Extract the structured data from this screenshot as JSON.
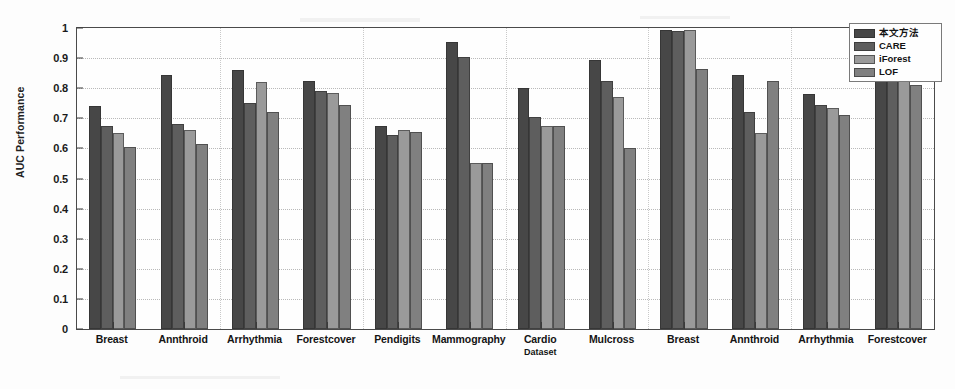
{
  "chart_data": {
    "type": "bar",
    "title": "",
    "subtitle": "",
    "xlabel": "Dataset",
    "ylabel": "AUC Performance",
    "ylim": [
      0,
      1
    ],
    "ytick_labels": [
      "0",
      "0.1",
      "0.2",
      "0.3",
      "0.4",
      "0.5",
      "0.6",
      "0.7",
      "0.8",
      "0.9",
      "1"
    ],
    "ytick_values": [
      0,
      0.1,
      0.2,
      0.3,
      0.4,
      0.5,
      0.6,
      0.7,
      0.8,
      0.9,
      1
    ],
    "grid": true,
    "legend_position": "top-right",
    "categories": [
      "Breast",
      "Annthroid",
      "Arrhythmia",
      "Forestcover",
      "Pendigits",
      "Mammography",
      "Cardio",
      "Mulcross",
      "Breast",
      "Annthroid",
      "Arrhythmia",
      "Forestcover"
    ],
    "series": [
      {
        "name": "本文方法",
        "color": "#474747",
        "values": [
          0.74,
          0.845,
          0.86,
          0.825,
          0.675,
          0.955,
          0.8,
          0.895,
          0.995,
          0.845,
          0.78,
          1.0
        ]
      },
      {
        "name": "CARE",
        "color": "#5e5e5e",
        "values": [
          0.675,
          0.68,
          0.75,
          0.79,
          0.645,
          0.905,
          0.705,
          0.825,
          0.99,
          0.72,
          0.745,
          0.93
        ]
      },
      {
        "name": "iForest",
        "color": "#9a9a9a",
        "values": [
          0.65,
          0.66,
          0.82,
          0.785,
          0.66,
          0.55,
          0.675,
          0.77,
          0.995,
          0.65,
          0.735,
          1.0
        ]
      },
      {
        "name": "LOF",
        "color": "#808080",
        "values": [
          0.605,
          0.615,
          0.72,
          0.745,
          0.655,
          0.55,
          0.675,
          0.6,
          0.865,
          0.825,
          0.71,
          0.81
        ]
      }
    ]
  }
}
